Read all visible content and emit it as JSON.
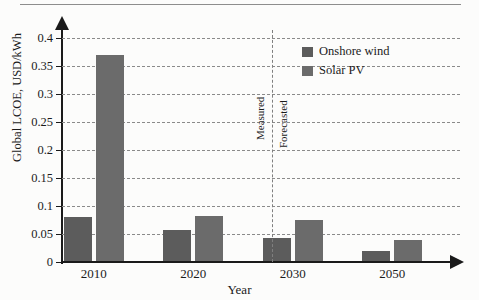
{
  "chart_data": {
    "type": "bar",
    "title": "",
    "xlabel": "Year",
    "ylabel": "Global LCOE, USD/kWh",
    "categories": [
      "2010",
      "2020",
      "2030",
      "2050"
    ],
    "series": [
      {
        "name": "Onshore wind",
        "color": "#5c5c5c",
        "values": [
          0.08,
          0.057,
          0.043,
          0.02
        ]
      },
      {
        "name": "Solar PV",
        "color": "#6b6b6b",
        "values": [
          0.37,
          0.083,
          0.075,
          0.04
        ]
      }
    ],
    "ylim": [
      0,
      0.4
    ],
    "yticks": [
      "0",
      "0.05",
      "0.1",
      "0.15",
      "0.2",
      "0.25",
      "0.3",
      "0.35",
      "0.4"
    ],
    "ytick_values": [
      0,
      0.05,
      0.1,
      0.15,
      0.2,
      0.25,
      0.3,
      0.35,
      0.4
    ],
    "grid": true,
    "legend_position": "top-right",
    "annotations": [
      {
        "name": "measured",
        "text": "Measured",
        "orientation": "vertical"
      },
      {
        "name": "forecasted",
        "text": "Forecasted",
        "orientation": "vertical"
      }
    ],
    "divider": {
      "between": [
        "2020",
        "2030"
      ],
      "style": "dashed"
    }
  }
}
